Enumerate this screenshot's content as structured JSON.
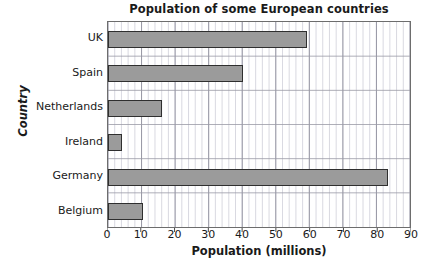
{
  "chart_data": {
    "type": "bar",
    "orientation": "horizontal",
    "title": "Population of some European countries",
    "xlabel": "Population (millions)",
    "ylabel": "Country",
    "categories": [
      "Belgium",
      "Germany",
      "Ireland",
      "Netherlands",
      "Spain",
      "UK"
    ],
    "values": [
      10.5,
      83,
      4,
      16,
      40,
      59
    ],
    "xlim": [
      0,
      90
    ],
    "xticks": [
      0,
      10,
      20,
      30,
      40,
      50,
      60,
      70,
      80,
      90
    ],
    "xtick_labels": [
      "0",
      "10",
      "20",
      "30",
      "40",
      "50",
      "60",
      "70",
      "80",
      "90"
    ],
    "minor_tick_step": 2,
    "grid": true,
    "legend": null,
    "bar_color": "#9b9b9b",
    "bar_edge_color": "#2f2f2f",
    "grid_color": "#c8c8d4",
    "frame_color": "#6d6d6d"
  }
}
